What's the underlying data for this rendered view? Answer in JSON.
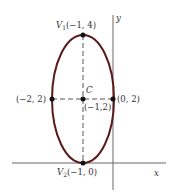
{
  "diagram": {
    "type": "ellipse-graph",
    "axes": {
      "x_label": "x",
      "y_label": "y"
    },
    "ellipse": {
      "color": "#5a1a1a",
      "center": {
        "x": -1,
        "y": 2
      },
      "semi_major": 2,
      "semi_minor": 1,
      "orientation": "vertical"
    },
    "points": {
      "v1": {
        "name": "V",
        "sub": "1",
        "coords": "(−1, 4)"
      },
      "v2": {
        "name": "V",
        "sub": "2",
        "coords": "(−1, 0)"
      },
      "center": {
        "name": "C",
        "coords": "(−1,2)"
      },
      "left": {
        "coords": "(−2, 2)"
      },
      "right": {
        "coords": "(0, 2)"
      }
    },
    "colors": {
      "axis": "#555555",
      "dashed": "#444444",
      "point": "#111111",
      "text": "#333333"
    }
  }
}
